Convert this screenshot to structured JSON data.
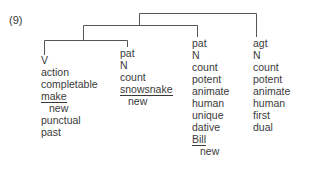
{
  "example_number": "(9)",
  "columns": [
    {
      "role": "V",
      "rows": [
        {
          "text": "V",
          "underline": false,
          "indent": false
        },
        {
          "text": "action",
          "underline": false,
          "indent": false
        },
        {
          "text": "completable",
          "underline": false,
          "indent": false
        },
        {
          "text": "make",
          "underline": true,
          "indent": false
        },
        {
          "text": "new",
          "underline": false,
          "indent": true
        },
        {
          "text": "punctual",
          "underline": false,
          "indent": false
        },
        {
          "text": "past",
          "underline": false,
          "indent": false
        }
      ]
    },
    {
      "role": "pat",
      "rows": [
        {
          "text": "pat",
          "underline": false,
          "indent": false
        },
        {
          "text": "N",
          "underline": false,
          "indent": false
        },
        {
          "text": "count",
          "underline": false,
          "indent": false
        },
        {
          "text": "snowsnake",
          "underline": true,
          "indent": false
        },
        {
          "text": "new",
          "underline": false,
          "indent": true
        }
      ]
    },
    {
      "role": "pat",
      "rows": [
        {
          "text": "pat",
          "underline": false,
          "indent": false
        },
        {
          "text": "N",
          "underline": false,
          "indent": false
        },
        {
          "text": "count",
          "underline": false,
          "indent": false
        },
        {
          "text": "potent",
          "underline": false,
          "indent": false
        },
        {
          "text": "animate",
          "underline": false,
          "indent": false
        },
        {
          "text": "human",
          "underline": false,
          "indent": false
        },
        {
          "text": "unique",
          "underline": false,
          "indent": false
        },
        {
          "text": "dative",
          "underline": false,
          "indent": false
        },
        {
          "text": "Bill",
          "underline": true,
          "indent": false
        },
        {
          "text": "new",
          "underline": false,
          "indent": true
        }
      ]
    },
    {
      "role": "agt",
      "rows": [
        {
          "text": "agt",
          "underline": false,
          "indent": false
        },
        {
          "text": "N",
          "underline": false,
          "indent": false
        },
        {
          "text": "count",
          "underline": false,
          "indent": false
        },
        {
          "text": "potent",
          "underline": false,
          "indent": false
        },
        {
          "text": "animate",
          "underline": false,
          "indent": false
        },
        {
          "text": "human",
          "underline": false,
          "indent": false
        },
        {
          "text": "first",
          "underline": false,
          "indent": false
        },
        {
          "text": "dual",
          "underline": false,
          "indent": false
        }
      ]
    }
  ]
}
